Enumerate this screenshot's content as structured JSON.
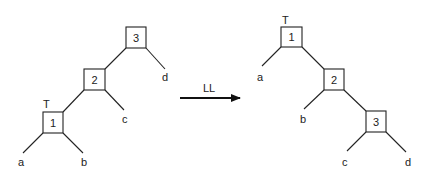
{
  "diagram": {
    "type": "tree-rotation",
    "transform": {
      "label": "LL",
      "direction": "left-to-right"
    },
    "before": {
      "root_marker": "T",
      "nodes": [
        {
          "id": "3",
          "label": "3",
          "left": "2",
          "right": "d"
        },
        {
          "id": "2",
          "label": "2",
          "left": "1",
          "right": "c"
        },
        {
          "id": "1",
          "label": "1",
          "left": "a",
          "right": "b",
          "marked": "T"
        }
      ],
      "leaves": [
        "a",
        "b",
        "c",
        "d"
      ]
    },
    "after": {
      "root_marker": "T",
      "nodes": [
        {
          "id": "1",
          "label": "1",
          "left": "a",
          "right": "2",
          "marked": "T"
        },
        {
          "id": "2",
          "label": "2",
          "left": "b",
          "right": "3"
        },
        {
          "id": "3",
          "label": "3",
          "left": "c",
          "right": "d"
        }
      ],
      "leaves": [
        "a",
        "b",
        "c",
        "d"
      ]
    }
  },
  "labels": {
    "left": {
      "n3": "3",
      "n2": "2",
      "n1": "1",
      "T": "T",
      "a": "a",
      "b": "b",
      "c": "c",
      "d": "d"
    },
    "arrow": "LL",
    "right": {
      "n1": "1",
      "n2": "2",
      "n3": "3",
      "T": "T",
      "a": "a",
      "b": "b",
      "c": "c",
      "d": "d"
    }
  }
}
